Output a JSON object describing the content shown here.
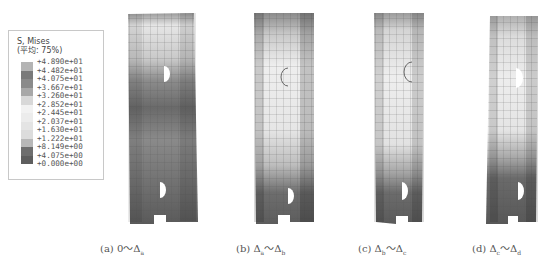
{
  "legend": {
    "title": "S, Mises",
    "subtitle": "(平均: 75%)",
    "labels": [
      "+4.890e+01",
      "+4.482e+01",
      "+4.075e+01",
      "+3.667e+01",
      "+3.260e+01",
      "+2.852e+01",
      "+2.445e+01",
      "+2.037e+01",
      "+1.630e+01",
      "+1.222e+01",
      "+8.149e+00",
      "+4.075e+00",
      "+0.000e+00"
    ],
    "colors": [
      "#b4b4b4",
      "#7a7a7a",
      "#8a8a8a",
      "#a8a8a8",
      "#d8d8d8",
      "#f2f2f2",
      "#ececec",
      "#e4e4e4",
      "#dcdcdc",
      "#b8b8b8",
      "#6e6e6e",
      "#5e5e5e",
      "#545454"
    ]
  },
  "panels": [
    {
      "id": "a",
      "caption_prefix": "(a) 0～Δ",
      "caption_sub1": "a",
      "caption_mid": "",
      "caption_sub2": ""
    },
    {
      "id": "b",
      "caption_prefix": "(b) Δ",
      "caption_sub1": "a",
      "caption_mid": "～Δ",
      "caption_sub2": "b"
    },
    {
      "id": "c",
      "caption_prefix": "(c) Δ",
      "caption_sub1": "b",
      "caption_mid": "～Δ",
      "caption_sub2": "c"
    },
    {
      "id": "d",
      "caption_prefix": "(d) Δ",
      "caption_sub1": "c",
      "caption_mid": "～Δ",
      "caption_sub2": "d"
    }
  ]
}
